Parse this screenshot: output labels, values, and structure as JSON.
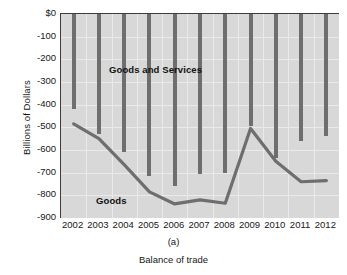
{
  "figure": {
    "panel_label": "(a)",
    "caption": "Balance of trade"
  },
  "chart_data": {
    "type": "bar",
    "title": "",
    "xlabel": "",
    "ylabel": "Billions of Dollars",
    "categories": [
      "2002",
      "2003",
      "2004",
      "2005",
      "2006",
      "2007",
      "2008",
      "2009",
      "2010",
      "2011",
      "2012"
    ],
    "ylim": [
      -900,
      0
    ],
    "yticks": [
      0,
      -100,
      -200,
      -300,
      -400,
      -500,
      -600,
      -700,
      -800,
      -900
    ],
    "ytick_labels": [
      "$0",
      "-100",
      "-200",
      "-300",
      "-400",
      "-500",
      "-600",
      "-700",
      "-800",
      "-900"
    ],
    "grid": true,
    "legend_position": "in-plot annotations",
    "series": [
      {
        "name": "Goods and Services",
        "type": "bar",
        "note": "vertical bars drawn from $0 down to each value",
        "values": [
          -420,
          -530,
          -610,
          -715,
          -760,
          -705,
          -700,
          -495,
          -635,
          -560,
          -540
        ]
      },
      {
        "name": "Goods",
        "type": "line",
        "values": [
          -485,
          -550,
          -665,
          -785,
          -838,
          -820,
          -835,
          -505,
          -650,
          -740,
          -735
        ]
      }
    ],
    "annotations": [
      {
        "text": "Goods and Services",
        "series": "Goods and Services"
      },
      {
        "text": "Goods",
        "series": "Goods"
      }
    ],
    "colors": {
      "bar": "#6e6e6e",
      "line": "#6e6e6e",
      "plot_background": "#d8d8d8",
      "grid": "#eaeaea",
      "axis": "#3d3d3d",
      "text": "#171717"
    }
  }
}
